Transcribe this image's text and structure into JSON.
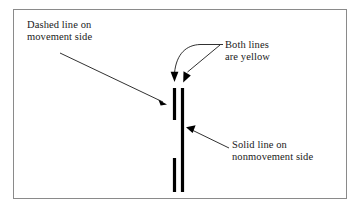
{
  "figure": {
    "background_color": "#ffffff",
    "border_color": "#8a8a8a",
    "ink_color": "#000000"
  },
  "annotations": {
    "dashed_label": {
      "name": "dashed-line-callout",
      "line1": "Dashed line on",
      "line2": "movement side"
    },
    "yellow_label": {
      "name": "both-lines-yellow-callout",
      "line1": "Both lines",
      "line2": "are yellow"
    },
    "solid_label": {
      "name": "solid-line-callout",
      "line1": "Solid line on",
      "line2": "nonmovement side"
    }
  },
  "markings": {
    "dashed_line": {
      "name": "dashed-lane-line",
      "style": "dashed",
      "color": "#000000",
      "x": 174,
      "segments": [
        {
          "y1": 88,
          "y2": 120
        },
        {
          "y1": 158,
          "y2": 192
        }
      ]
    },
    "solid_line": {
      "name": "solid-lane-line",
      "style": "solid",
      "color": "#000000",
      "x": 182,
      "y1": 88,
      "y2": 192
    }
  },
  "leaders": {
    "dashed_arrow": {
      "name": "dashed-line-leader-arrow",
      "from": [
        60,
        53
      ],
      "to": [
        166,
        104
      ]
    },
    "yellow_stem": {
      "name": "both-lines-leader-stem",
      "from": [
        222,
        44
      ],
      "to": [
        200,
        44
      ]
    },
    "yellow_arrow_left": {
      "name": "both-lines-arrow-to-dashed",
      "to": [
        174,
        84
      ]
    },
    "yellow_arrow_right": {
      "name": "both-lines-arrow-to-solid",
      "from": [
        218,
        45
      ],
      "to": [
        185,
        84
      ]
    },
    "solid_arrow": {
      "name": "solid-line-leader-arrow",
      "from": [
        229,
        148
      ],
      "to": [
        186,
        128
      ]
    }
  }
}
